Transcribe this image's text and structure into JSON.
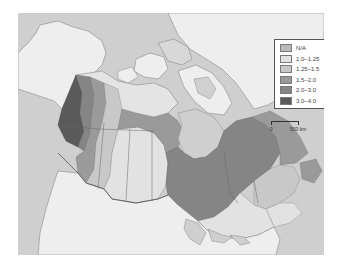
{
  "map": {
    "region": "Canada",
    "background_color": "#cfcfcf",
    "land_color": "#eeeeee"
  },
  "legend": {
    "items": [
      {
        "label": "N/A",
        "color": "#b9b9b9"
      },
      {
        "label": "1.0–1.25",
        "color": "#e2e2e2"
      },
      {
        "label": "1.25–1.5",
        "color": "#c8c8c8"
      },
      {
        "label": "1.5–2.0",
        "color": "#9a9a9a"
      },
      {
        "label": "2.0–3.0",
        "color": "#858585"
      },
      {
        "label": "3.0–4.0",
        "color": "#5a5a5a"
      }
    ]
  },
  "scale_bar": {
    "start_label": "0",
    "end_label": "500 km"
  }
}
